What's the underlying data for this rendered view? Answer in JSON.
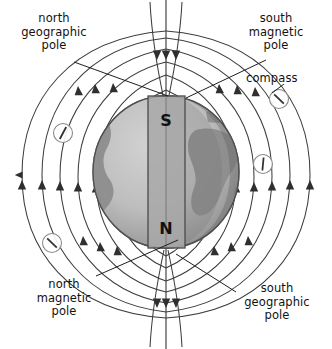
{
  "figure": {
    "background_color": "#ffffff",
    "line_color": "#3a3a3a",
    "text_color": "#111111"
  },
  "labels": {
    "north_geographic_pole": "north\ngeographic\npole",
    "south_magnetic_pole": "south\nmagnetic\npole",
    "compass": "compass",
    "north_magnetic_pole": "north\nmagnetic\npole",
    "south_geographic_pole": "south\ngeographic\npole"
  },
  "magnet": {
    "top_pole_label": "S",
    "bottom_pole_label": "N",
    "fill_color": "#a8a8a8",
    "stroke_color": "#4a4a4a"
  },
  "earth": {
    "ocean_color": "#bdbdbd",
    "land_color": "#8f8f8f",
    "outline_color": "#5a5a5a",
    "shadow_color": "#9a9a9a"
  },
  "compasses": [
    {
      "name": "compass-left-upper",
      "cx": 63,
      "cy": 133,
      "needle_angle_deg": 70
    },
    {
      "name": "compass-right-upper",
      "cx": 279,
      "cy": 99,
      "needle_angle_deg": 130
    },
    {
      "name": "compass-right-lower",
      "cx": 263,
      "cy": 164,
      "needle_angle_deg": 95
    },
    {
      "name": "compass-left-lower",
      "cx": 52,
      "cy": 243,
      "needle_angle_deg": 130
    }
  ],
  "field": {
    "type": "dipole-magnetic-field-lines",
    "arrow_direction": "upward along outer loops, downward into poles",
    "loop_count": 7,
    "arrow_marker_count": 22
  },
  "leader_lines": [
    {
      "name": "leader-north-geographic-pole",
      "x1": 74,
      "y1": 62,
      "x2": 168,
      "y2": 96
    },
    {
      "name": "leader-south-magnetic-pole",
      "x1": 266,
      "y1": 60,
      "x2": 186,
      "y2": 98
    },
    {
      "name": "leader-compass",
      "x1": 282,
      "y1": 86,
      "x2": 272,
      "y2": 94
    },
    {
      "name": "leader-north-magnetic-pole",
      "x1": 96,
      "y1": 276,
      "x2": 178,
      "y2": 240
    },
    {
      "name": "leader-south-geographic-pole",
      "x1": 236,
      "y1": 292,
      "x2": 176,
      "y2": 254
    }
  ]
}
